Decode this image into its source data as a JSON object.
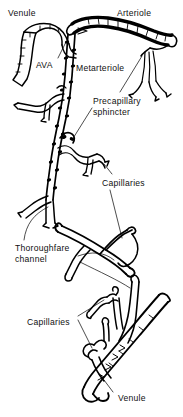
{
  "figure": {
    "background_color": "#ffffff",
    "ink_color": "#000000",
    "width": 183,
    "height": 417
  },
  "labels": [
    {
      "id": "venule-top",
      "text": "Venule",
      "x": 8,
      "y": 8,
      "name": "label-venule-top"
    },
    {
      "id": "arteriole",
      "text": "Arteriole",
      "x": 117,
      "y": 8,
      "name": "label-arteriole"
    },
    {
      "id": "ava",
      "text": "AVA",
      "x": 36,
      "y": 60,
      "name": "label-ava"
    },
    {
      "id": "metarteriole",
      "text": "Metarteriole",
      "x": 76,
      "y": 63,
      "name": "label-metarteriole"
    },
    {
      "id": "precapillary",
      "text": "Precapillary\nsphincter",
      "x": 93,
      "y": 96,
      "name": "label-precapillary-sphincter"
    },
    {
      "id": "capillaries-mid",
      "text": "Capillaries",
      "x": 102,
      "y": 178,
      "name": "label-capillaries-middle"
    },
    {
      "id": "thoroughfare",
      "text": "Thoroughfare\nchannel",
      "x": 15,
      "y": 243,
      "name": "label-thoroughfare-channel"
    },
    {
      "id": "capillaries-low",
      "text": "Capillaries",
      "x": 27,
      "y": 317,
      "name": "label-capillaries-lower"
    },
    {
      "id": "venule-bottom",
      "text": "Venule",
      "x": 118,
      "y": 393,
      "name": "label-venule-bottom"
    }
  ],
  "structures": [
    {
      "id": "venule-top-vessel",
      "name": "venule-top-vessel",
      "description": "Venule tube at upper left"
    },
    {
      "id": "ava-vessel",
      "name": "ava-vessel",
      "description": "Arteriovenous anastomosis linking arteriole to venule"
    },
    {
      "id": "arteriole-vessel",
      "name": "arteriole-vessel",
      "description": "Thick arteriole arching across the top"
    },
    {
      "id": "metarteriole-vessel",
      "name": "metarteriole-vessel",
      "description": "Metarteriole descending with smooth muscle cells"
    },
    {
      "id": "sphincter-ring",
      "name": "precapillary-sphincter",
      "description": "Precapillary sphincter at capillary origin"
    },
    {
      "id": "capillary-network-upper",
      "name": "capillary-network-upper",
      "description": "Upper capillary branches"
    },
    {
      "id": "thoroughfare-vessel",
      "name": "thoroughfare-channel-vessel",
      "description": "Thoroughfare channel crossing mid-field"
    },
    {
      "id": "capillary-network-lower",
      "name": "capillary-network-lower",
      "description": "Lower capillary branches draining to venule"
    },
    {
      "id": "venule-bottom-vessel",
      "name": "venule-bottom-vessel",
      "description": "Venule collecting vessel at bottom"
    }
  ],
  "leaders": [
    {
      "id": "ava-leader",
      "name": "leader-line-ava"
    },
    {
      "id": "sphincter-leader",
      "name": "leader-line-precapillary-sphincter"
    },
    {
      "id": "sphincter-leader-2",
      "name": "leader-line-precapillary-sphincter-upper"
    },
    {
      "id": "capillaries-mid-leader-a",
      "name": "leader-line-capillaries-middle-a"
    },
    {
      "id": "capillaries-mid-leader-b",
      "name": "leader-line-capillaries-middle-b"
    },
    {
      "id": "thoroughfare-leader-a",
      "name": "leader-line-thoroughfare-a"
    },
    {
      "id": "thoroughfare-leader-b",
      "name": "leader-line-thoroughfare-b"
    },
    {
      "id": "capillaries-low-leader-a",
      "name": "leader-line-capillaries-lower-a"
    },
    {
      "id": "capillaries-low-leader-b",
      "name": "leader-line-capillaries-lower-b"
    },
    {
      "id": "venule-bottom-leader",
      "name": "leader-line-venule-bottom"
    }
  ]
}
